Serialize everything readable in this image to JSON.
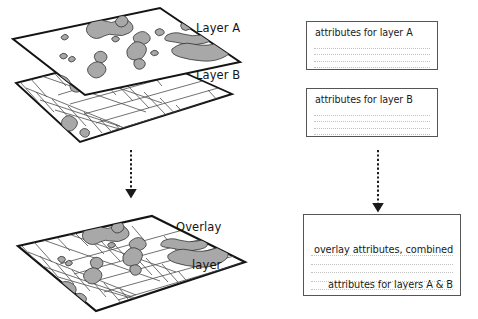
{
  "diagram": {
    "title_implied": "GIS layer overlay diagram",
    "background_color": "#ffffff",
    "ink_color": "#141414",
    "polygon_fill": "#a8a8a8",
    "parcel_line_color": "#4d4d4d",
    "box_border_color": "#555555",
    "row_line_color": "#c2c2c2"
  },
  "labels": {
    "layer_a": "Layer A",
    "layer_b": "Layer B",
    "overlay_line1": "Overlay",
    "overlay_line2": "layer"
  },
  "maps": {
    "layer_a": {
      "name": "Layer A",
      "content": "irregular gray polygons (hydrography / vegetation features)"
    },
    "layer_b": {
      "name": "Layer B",
      "content": "rectangular parcel grid boundaries"
    },
    "overlay": {
      "name": "Overlay layer",
      "content": "parcel grid with polygons intersected and split"
    }
  },
  "attribute_tables": {
    "layer_a": {
      "title": "attributes for layer A",
      "row_count": 5
    },
    "layer_b": {
      "title": "attributes for layer B",
      "row_count": 5
    },
    "overlay": {
      "title_line1": "overlay attributes, combined",
      "title_line2": "attributes for layers A & B",
      "row_count": 6
    }
  },
  "arrows": {
    "left": {
      "style": "dashed",
      "direction": "down",
      "from": "stacked layers A and B",
      "to": "overlay layer map"
    },
    "right": {
      "style": "dashed",
      "direction": "down",
      "from": "attribute tables A and B",
      "to": "overlay attribute table"
    }
  }
}
